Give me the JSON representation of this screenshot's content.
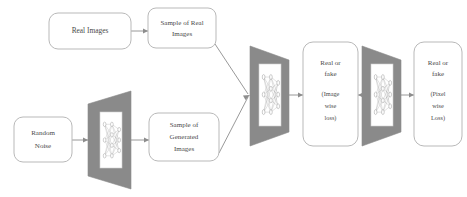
{
  "diagram": {
    "colors": {
      "background": "#ffffff",
      "box_stroke": "#b9b9b9",
      "box_fill": "#ffffff",
      "trapezoid_fill": "#8a8a8a",
      "trapezoid_inner_fill": "#ffffff",
      "connector": "#8d8d8d",
      "text": "#4a4a4a"
    },
    "nodes": {
      "real_images": {
        "label": "Real Images",
        "lines": [
          "Real Images"
        ]
      },
      "sample_real_images": {
        "label": "Sample of  Real Images",
        "lines": [
          "Sample of  Real",
          "Images"
        ]
      },
      "random_noise": {
        "label": "Random Noise",
        "lines": [
          "Random",
          "Noise"
        ]
      },
      "sample_generated_images": {
        "label": "Sample of Generated Images",
        "lines": [
          "Sample of",
          "Generated",
          "Images"
        ]
      },
      "generator": {
        "label": "generator-network",
        "icon": "neural-network-icon"
      },
      "discriminator_image": {
        "label": "discriminator-network-image",
        "icon": "neural-network-icon"
      },
      "discriminator_pixel": {
        "label": "discriminator-network-pixel",
        "icon": "neural-network-icon"
      },
      "image_wise_loss": {
        "label": "Real or fake (Image wise loss)",
        "lines": [
          "Real or",
          "fake"
        ],
        "sub_lines": [
          "(Image",
          "wise",
          "loss)"
        ]
      },
      "pixel_wise_loss": {
        "label": "Real or fake (Pixel wise Loss)",
        "lines": [
          "Real or",
          "fake"
        ],
        "sub_lines": [
          "(Pixel",
          "wise",
          "Loss)"
        ]
      }
    },
    "connections": [
      {
        "name": "real-images-to-sample-real",
        "from": "real_images",
        "to": "sample_real_images",
        "direction": "right"
      },
      {
        "name": "random-noise-to-generator",
        "from": "random_noise",
        "to": "generator",
        "direction": "right"
      },
      {
        "name": "generator-to-sample-generated",
        "from": "generator",
        "to": "sample_generated_images",
        "direction": "right"
      },
      {
        "name": "sample-real-to-discriminator",
        "from": "sample_real_images",
        "to": "discriminator_image",
        "direction": "diagonal-down"
      },
      {
        "name": "sample-generated-to-discriminator",
        "from": "sample_generated_images",
        "to": "discriminator_image",
        "direction": "diagonal-up"
      },
      {
        "name": "discriminator-to-image-loss",
        "from": "discriminator_image",
        "to": "image_wise_loss",
        "direction": "right"
      },
      {
        "name": "pixel-discriminator-to-image-loss",
        "from": "discriminator_pixel",
        "to": "image_wise_loss",
        "direction": "left"
      },
      {
        "name": "pixel-discriminator-to-pixel-loss",
        "from": "discriminator_pixel",
        "to": "pixel_wise_loss",
        "direction": "right"
      }
    ]
  }
}
